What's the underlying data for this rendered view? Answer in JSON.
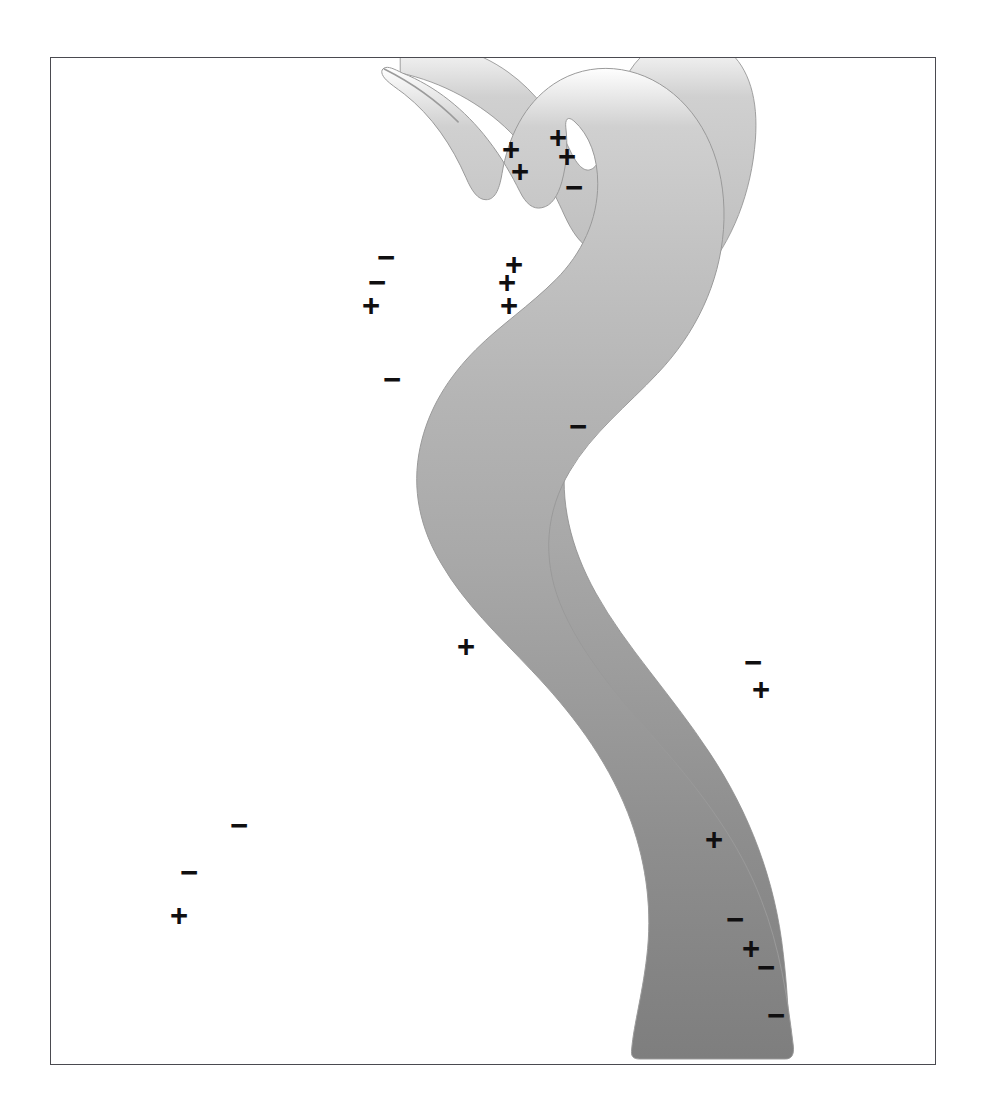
{
  "figure": {
    "canvas": {
      "width": 987,
      "height": 1116
    },
    "frame": {
      "x": 50,
      "y": 57,
      "width": 886,
      "height": 1008,
      "border_color": "#4a4a50",
      "border_width": 1.6,
      "background_color": "#ffffff"
    },
    "band": {
      "name": "gradient-curved-band",
      "description": "S-curved tapering band, thin at top, broad at bottom, filled with a vertical gray gradient",
      "gradient": {
        "direction": "vertical",
        "stops": [
          {
            "offset": 0.0,
            "color": "#ffffff"
          },
          {
            "offset": 0.06,
            "color": "#d0d0d0"
          },
          {
            "offset": 0.18,
            "color": "#c3c3c3"
          },
          {
            "offset": 0.34,
            "color": "#b4b4b4"
          },
          {
            "offset": 0.5,
            "color": "#a8a8a8"
          },
          {
            "offset": 0.64,
            "color": "#9b9b9b"
          },
          {
            "offset": 0.78,
            "color": "#8e8e8e"
          },
          {
            "offset": 0.9,
            "color": "#858585"
          },
          {
            "offset": 1.0,
            "color": "#7e7e7e"
          }
        ]
      },
      "outline_color": "#8c8c8c"
    },
    "legend_symbols": {
      "plus": "+",
      "minus": "−"
    },
    "charges": [
      {
        "id": "c01",
        "sign": "+",
        "x": 510,
        "y": 148
      },
      {
        "id": "c02",
        "sign": "+",
        "x": 557,
        "y": 136
      },
      {
        "id": "c03",
        "sign": "+",
        "x": 519,
        "y": 170
      },
      {
        "id": "c04",
        "sign": "+",
        "x": 566,
        "y": 155
      },
      {
        "id": "c05",
        "sign": "−",
        "x": 573,
        "y": 186
      },
      {
        "id": "c06",
        "sign": "−",
        "x": 385,
        "y": 256
      },
      {
        "id": "c07",
        "sign": "+",
        "x": 513,
        "y": 263
      },
      {
        "id": "c08",
        "sign": "−",
        "x": 376,
        "y": 281
      },
      {
        "id": "c09",
        "sign": "+",
        "x": 506,
        "y": 281
      },
      {
        "id": "c10",
        "sign": "+",
        "x": 370,
        "y": 304
      },
      {
        "id": "c11",
        "sign": "+",
        "x": 508,
        "y": 304
      },
      {
        "id": "c12",
        "sign": "−",
        "x": 391,
        "y": 378
      },
      {
        "id": "c13",
        "sign": "−",
        "x": 577,
        "y": 425
      },
      {
        "id": "c14",
        "sign": "+",
        "x": 465,
        "y": 645
      },
      {
        "id": "c15",
        "sign": "−",
        "x": 752,
        "y": 661
      },
      {
        "id": "c16",
        "sign": "+",
        "x": 760,
        "y": 688
      },
      {
        "id": "c17",
        "sign": "−",
        "x": 238,
        "y": 824
      },
      {
        "id": "c18",
        "sign": "+",
        "x": 713,
        "y": 838
      },
      {
        "id": "c19",
        "sign": "−",
        "x": 188,
        "y": 871
      },
      {
        "id": "c20",
        "sign": "+",
        "x": 178,
        "y": 914
      },
      {
        "id": "c21",
        "sign": "−",
        "x": 734,
        "y": 918
      },
      {
        "id": "c22",
        "sign": "+",
        "x": 750,
        "y": 947
      },
      {
        "id": "c23",
        "sign": "−",
        "x": 765,
        "y": 966
      },
      {
        "id": "c24",
        "sign": "−",
        "x": 775,
        "y": 1014
      }
    ],
    "counts": {
      "plus_total": 12,
      "minus_total": 12,
      "total": 24
    }
  }
}
